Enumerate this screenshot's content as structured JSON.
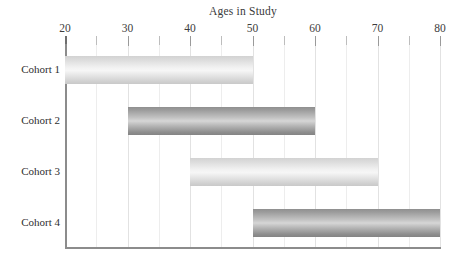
{
  "chart_data": {
    "type": "bar",
    "orientation": "horizontal",
    "subtype": "floating-range-bar",
    "title": "Ages in Study",
    "xlabel": "",
    "ylabel": "",
    "categories": [
      "Cohort 1",
      "Cohort 2",
      "Cohort 3",
      "Cohort 4"
    ],
    "series": [
      {
        "name": "Age range",
        "ranges": [
          {
            "category": "Cohort 1",
            "start": 20,
            "end": 50,
            "span": 30,
            "fill": "light"
          },
          {
            "category": "Cohort 2",
            "start": 30,
            "end": 60,
            "span": 30,
            "fill": "dark"
          },
          {
            "category": "Cohort 3",
            "start": 40,
            "end": 70,
            "span": 30,
            "fill": "light"
          },
          {
            "category": "Cohort 4",
            "start": 50,
            "end": 80,
            "span": 30,
            "fill": "dark"
          }
        ]
      }
    ],
    "xlim": [
      20,
      80
    ],
    "xticks": [
      20,
      30,
      40,
      50,
      60,
      70,
      80
    ],
    "xtick_labels": [
      "20",
      "30",
      "40",
      "50",
      "60",
      "70",
      "80"
    ],
    "xminor_ticks": [
      25,
      35,
      45,
      55,
      65,
      75
    ],
    "grid": true,
    "grid_axis": "x",
    "legend": false,
    "colors": {
      "light_bar": "#e3e3e3",
      "dark_bar": "#a8a8a8",
      "gridline": "#e2e2e2",
      "axis": "#8c8c8c",
      "text": "#2e2e2e",
      "background": "#ffffff"
    }
  },
  "axis": {
    "ticks": [
      {
        "value": 20,
        "label": "20",
        "major": true
      },
      {
        "value": 25,
        "label": "",
        "major": false
      },
      {
        "value": 30,
        "label": "30",
        "major": true
      },
      {
        "value": 35,
        "label": "",
        "major": false
      },
      {
        "value": 40,
        "label": "40",
        "major": true
      },
      {
        "value": 45,
        "label": "",
        "major": false
      },
      {
        "value": 50,
        "label": "50",
        "major": true
      },
      {
        "value": 55,
        "label": "",
        "major": false
      },
      {
        "value": 60,
        "label": "60",
        "major": true
      },
      {
        "value": 65,
        "label": "",
        "major": false
      },
      {
        "value": 70,
        "label": "70",
        "major": true
      },
      {
        "value": 75,
        "label": "",
        "major": false
      },
      {
        "value": 80,
        "label": "80",
        "major": true
      }
    ]
  }
}
